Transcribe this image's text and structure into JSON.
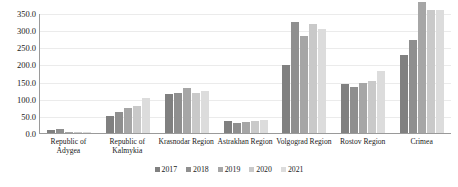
{
  "chart_data": {
    "type": "bar",
    "title": "",
    "subtitle": "",
    "xlabel": "",
    "ylabel": "",
    "ylim": [
      0,
      350
    ],
    "y_ticks": [
      "0.0",
      "50.0",
      "100.0",
      "150.0",
      "200.0",
      "250.0",
      "300.0",
      "350.0"
    ],
    "y_tick_values": [
      0,
      50,
      100,
      150,
      200,
      250,
      300,
      350
    ],
    "grid": true,
    "legend_position": "bottom",
    "categories": [
      "Republic of Adygea",
      "Republic of Kalmykia",
      "Krasnodar Region",
      "Astrakhan Region",
      "Volgograd Region",
      "Rostov Region",
      "Crimea"
    ],
    "series": [
      {
        "name": "2017",
        "color": "#808080",
        "values": [
          8,
          49,
          115,
          35,
          197,
          143,
          228
        ]
      },
      {
        "name": "2018",
        "color": "#8f8f8f",
        "values": [
          13,
          60,
          116,
          28,
          323,
          134,
          271
        ]
      },
      {
        "name": "2019",
        "color": "#a6a6a6",
        "values": [
          3,
          72,
          130,
          32,
          283,
          147,
          381
        ]
      },
      {
        "name": "2020",
        "color": "#c9c9c9",
        "values": [
          3,
          79,
          117,
          35,
          318,
          151,
          358
        ]
      },
      {
        "name": "2021",
        "color": "#dcdcdc",
        "values": [
          3,
          103,
          123,
          39,
          304,
          182,
          358
        ]
      }
    ]
  },
  "colors": {
    "axis": "#9a9a9a",
    "gridline": "#ebebeb",
    "text": "#1a1a1a",
    "background": "#ffffff"
  }
}
